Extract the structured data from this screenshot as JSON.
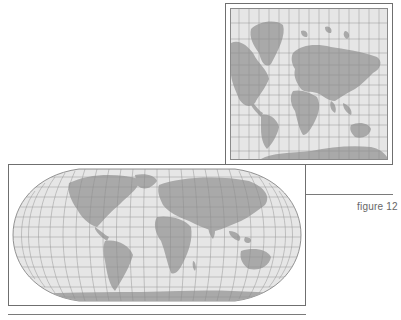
{
  "figure": {
    "caption": "figure 12",
    "maps": [
      {
        "name": "Mercator projection world map",
        "shape": "rectangular",
        "position": "top-right"
      },
      {
        "name": "Robinson projection world map",
        "shape": "rounded pseudo-cylindrical",
        "position": "bottom-left"
      }
    ]
  },
  "colors": {
    "land": "#a9a9a9",
    "ocean": "#e6e6e6",
    "graticule": "#8c8c8c",
    "frame": "#6f6f6f",
    "caption": "#666666"
  }
}
